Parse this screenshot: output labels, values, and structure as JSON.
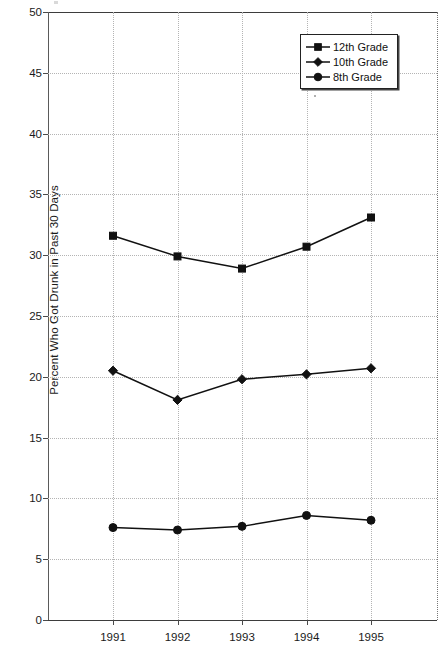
{
  "chart_data": {
    "type": "line",
    "title": "",
    "xlabel": "",
    "ylabel": "Percent Who Got Drunk in Past 30 Days",
    "categories": [
      "1991",
      "1992",
      "1993",
      "1994",
      "1995"
    ],
    "ylim": [
      0,
      50
    ],
    "ytick_step": 5,
    "yticks": [
      "50",
      "45",
      "40",
      "35",
      "30",
      "25",
      "20",
      "15",
      "10",
      "5",
      "0"
    ],
    "grid": true,
    "legend_position": "top-right",
    "series": [
      {
        "name": "12th Grade",
        "marker": "square",
        "values": [
          31.6,
          29.9,
          28.9,
          30.7,
          33.1
        ]
      },
      {
        "name": "10th Grade",
        "marker": "diamond",
        "values": [
          20.5,
          18.1,
          19.8,
          20.2,
          20.7
        ]
      },
      {
        "name": "8th Grade",
        "marker": "circle",
        "values": [
          7.6,
          7.4,
          7.7,
          8.6,
          8.2
        ]
      }
    ],
    "colors": {
      "series_line": "#111111",
      "marker": "#111111",
      "gridline": "#b4b4b4",
      "axis": "#3d3d3d",
      "background": "#ffffff"
    }
  },
  "legend": {
    "entries": [
      {
        "label": "12th Grade",
        "marker": "square"
      },
      {
        "label": "10th Grade",
        "marker": "diamond"
      },
      {
        "label": "8th Grade",
        "marker": "circle"
      }
    ]
  }
}
